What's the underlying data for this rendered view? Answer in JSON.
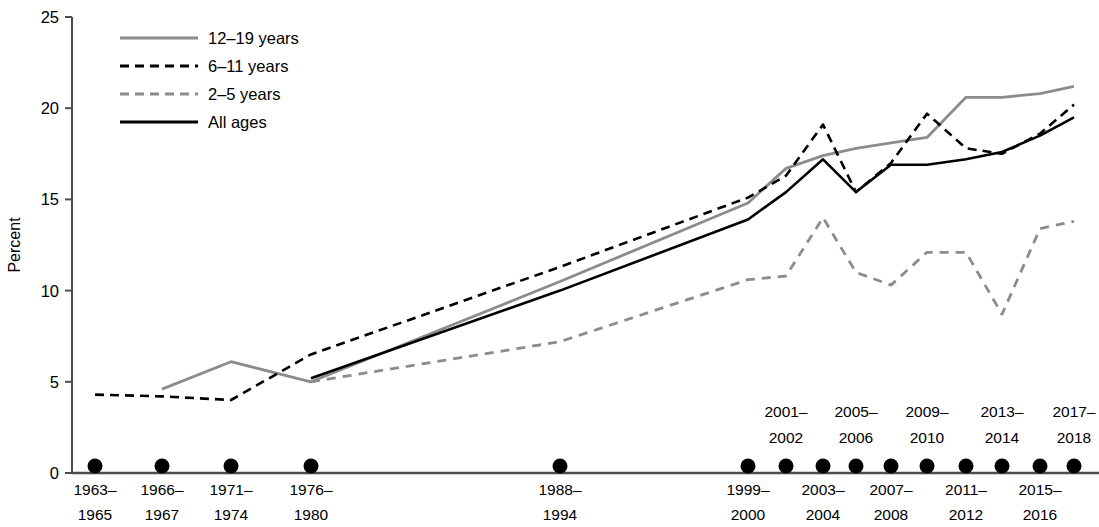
{
  "chart_data": {
    "type": "line",
    "title": "",
    "subtitle": "",
    "xlabel": "",
    "ylabel": "Percent",
    "ylim": [
      0,
      25
    ],
    "yticks": [
      0,
      5,
      10,
      15,
      20,
      25
    ],
    "ytick_labels": [
      "0",
      "5",
      "10",
      "15",
      "20",
      "25"
    ],
    "grid": false,
    "legend_position": "top-left",
    "categories": [
      "1963–1965",
      "1966–1967",
      "1971–1974",
      "1976–1980",
      "1988–1994",
      "1999–2000",
      "2001–2002",
      "2003–2004",
      "2005–2006",
      "2007–2008",
      "2009–2010",
      "2011–2012",
      "2013–2014",
      "2015–2016",
      "2017–2018"
    ],
    "category_labels_below": [
      "1963–1965",
      "1966–1967",
      "1971–1974",
      "1976–1980",
      "1988–1994",
      "1999–2000",
      "2003–2004",
      "2007–2008",
      "2011–2012",
      "2015–2016"
    ],
    "category_labels_above": [
      "2001–2002",
      "2005–2006",
      "2009–2010",
      "2013–2014",
      "2017–2018"
    ],
    "series": [
      {
        "name": "12–19 years",
        "style": "solid",
        "color": "#8c8c8c",
        "values": [
          null,
          4.6,
          6.1,
          5.0,
          10.5,
          14.8,
          16.7,
          17.4,
          17.8,
          18.1,
          18.4,
          20.6,
          20.6,
          20.8,
          21.2
        ]
      },
      {
        "name": "6–11 years",
        "style": "dashed",
        "color": "#000000",
        "values": [
          4.3,
          4.2,
          4.0,
          6.5,
          11.3,
          15.1,
          16.3,
          19.1,
          15.4,
          17.0,
          19.7,
          17.8,
          17.5,
          18.6,
          20.2
        ]
      },
      {
        "name": "2–5 years",
        "style": "dashed",
        "color": "#8c8c8c",
        "values": [
          null,
          null,
          null,
          5.0,
          7.2,
          10.6,
          10.8,
          14.0,
          11.0,
          10.3,
          12.1,
          12.1,
          8.7,
          13.4,
          13.8
        ]
      },
      {
        "name": "All ages",
        "style": "solid",
        "color": "#000000",
        "values": [
          null,
          null,
          null,
          5.2,
          10.0,
          13.9,
          15.4,
          17.2,
          15.4,
          16.9,
          16.9,
          17.2,
          17.6,
          18.5,
          19.5
        ]
      }
    ],
    "legend": [
      {
        "label": "12–19 years",
        "style": "solid",
        "color": "#8c8c8c"
      },
      {
        "label": "6–11 years",
        "style": "dashed",
        "color": "#000000"
      },
      {
        "label": "2–5 years",
        "style": "dashed",
        "color": "#8c8c8c"
      },
      {
        "label": "All ages",
        "style": "solid",
        "color": "#000000"
      }
    ],
    "marker": {
      "shape": "circle",
      "color": "#000000",
      "on_axis": true
    }
  }
}
